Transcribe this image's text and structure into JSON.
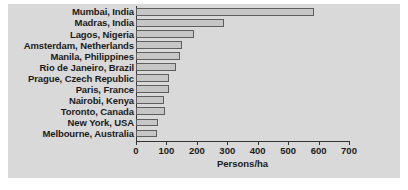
{
  "chart_data": {
    "type": "bar",
    "orientation": "horizontal",
    "title": "",
    "xlabel": "Persons/ha",
    "ylabel": "",
    "xlim": [
      0,
      700
    ],
    "xticks": [
      0,
      100,
      200,
      300,
      400,
      500,
      600,
      700
    ],
    "grid": false,
    "legend": null,
    "categories": [
      "Mumbai, India",
      "Madras, India",
      "Lagos, Nigeria",
      "Amsterdam, Netherlands",
      "Manila, Philippines",
      "Rio de Janeiro, Brazil",
      "Prague, Czech Republic",
      "Paris, France",
      "Nairobi, Kenya",
      "Toronto, Canada",
      "New York, USA",
      "Melbourne, Australia"
    ],
    "values": [
      585,
      290,
      190,
      150,
      145,
      132,
      110,
      108,
      92,
      95,
      73,
      70
    ],
    "bar_fill_color": "#c6c6c6",
    "bar_edge_color": "#5e5e5e",
    "panel_background_color": "#d9d9d9",
    "figure_background_color": "#ffffff",
    "axis_color": "#333333",
    "text_color": "#1b1b1b"
  }
}
